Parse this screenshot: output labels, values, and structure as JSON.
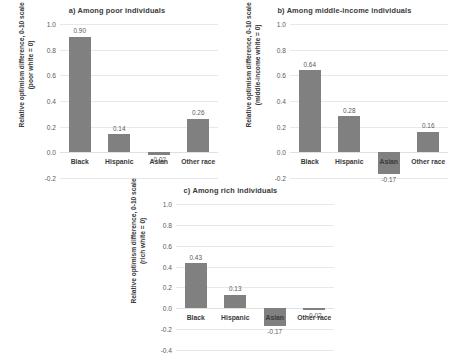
{
  "chart_data": [
    {
      "type": "bar",
      "panel": "a",
      "title": "a) Among poor individuals",
      "categories": [
        "Black",
        "Hispanic",
        "Asian",
        "Other race"
      ],
      "values": [
        0.9,
        0.14,
        -0.02,
        0.26
      ],
      "value_labels": [
        "0.90",
        "0.14",
        "-0.02",
        "0.26"
      ],
      "xlabel": "",
      "ylabel": "Relative optimism difference, 0-10 scale (poor white = 0)",
      "ylabel_line1": "Relative optimism difference, 0-10 scale",
      "ylabel_line2": "(poor white = 0)",
      "ylim": [
        -0.2,
        1.0
      ],
      "yticks": [
        1.0,
        0.8,
        0.6,
        0.4,
        0.2,
        0.0,
        -0.2
      ],
      "ytick_labels": [
        "1.0",
        "0.8",
        "0.6",
        "0.4",
        "0.2",
        "0.0",
        "-0.2"
      ],
      "grid": true,
      "legend": "none",
      "bar_color": "#808080"
    },
    {
      "type": "bar",
      "panel": "b",
      "title": "b) Among middle-income individuals",
      "categories": [
        "Black",
        "Hispanic",
        "Asian",
        "Other race"
      ],
      "values": [
        0.64,
        0.28,
        -0.17,
        0.16
      ],
      "value_labels": [
        "0.64",
        "0.28",
        "-0.17",
        "0.16"
      ],
      "xlabel": "",
      "ylabel": "Relative optimism difference, 0-10 scale (middle-income white = 0)",
      "ylabel_line1": "Relative optimism difference, 0-10 scale",
      "ylabel_line2": "(middle-income white = 0)",
      "ylim": [
        -0.2,
        1.0
      ],
      "yticks": [
        1.0,
        0.8,
        0.6,
        0.4,
        0.2,
        0.0,
        -0.2
      ],
      "ytick_labels": [
        "1.0",
        "0.8",
        "0.6",
        "0.4",
        "0.2",
        "0.0",
        "-0.2"
      ],
      "grid": true,
      "legend": "none",
      "bar_color": "#808080"
    },
    {
      "type": "bar",
      "panel": "c",
      "title": "c) Among rich individuals",
      "categories": [
        "Black",
        "Hispanic",
        "Asian",
        "Other race"
      ],
      "values": [
        0.43,
        0.13,
        -0.17,
        -0.02
      ],
      "value_labels": [
        "0.43",
        "0.13",
        "-0.17",
        "-0.02"
      ],
      "xlabel": "",
      "ylabel": "Relative optimism difference, 0-10 scale (rich white = 0)",
      "ylabel_line1": "Relative optimism difference, 0-10 scale",
      "ylabel_line2": "(rich white = 0)",
      "ylim": [
        -0.4,
        1.0
      ],
      "yticks": [
        1.0,
        0.8,
        0.6,
        0.4,
        0.2,
        0.0,
        -0.2,
        -0.4
      ],
      "ytick_labels": [
        "1.0",
        "0.8",
        "0.6",
        "0.4",
        "0.2",
        "0.0",
        "-0.2",
        "-0.4"
      ],
      "grid": true,
      "legend": "none",
      "bar_color": "#808080"
    }
  ]
}
